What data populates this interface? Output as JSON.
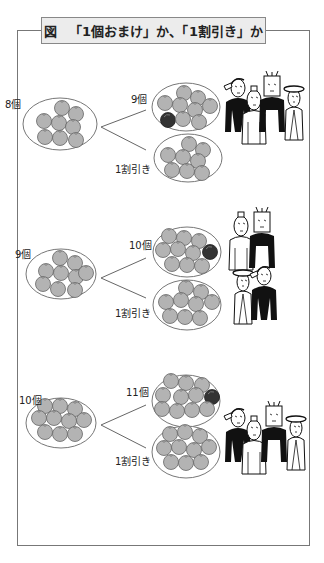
{
  "title": {
    "prefix": "図",
    "text": "「1個おまけ」か、「1割引き」か"
  },
  "colors": {
    "orange": "#b3b3b3",
    "orange_stroke": "#666666",
    "extra_orange": "#333333",
    "frame": "#777777",
    "title_bg": "#ececec"
  },
  "rows": [
    {
      "base_label": "8個",
      "bonus_label": "9個",
      "discount_label": "1割引き",
      "base_count": 8,
      "bonus_count": 9,
      "discount_count": 8,
      "people_choice": "bonus"
    },
    {
      "base_label": "9個",
      "bonus_label": "10個",
      "discount_label": "1割引き",
      "base_count": 9,
      "bonus_count": 10,
      "discount_count": 9,
      "people_choice": "split"
    },
    {
      "base_label": "10個",
      "bonus_label": "11個",
      "discount_label": "1割引き",
      "base_count": 10,
      "bonus_count": 11,
      "discount_count": 10,
      "people_choice": "bonus"
    }
  ]
}
